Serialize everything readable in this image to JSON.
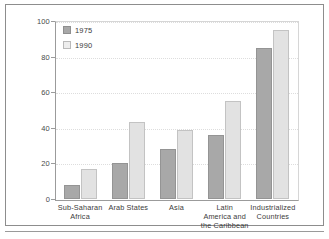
{
  "chart_data": {
    "type": "bar",
    "title": "",
    "subtitle": "",
    "xlabel": "",
    "ylabel": "",
    "ylim": [
      0,
      100
    ],
    "yticks": [
      0,
      20,
      40,
      60,
      80,
      100
    ],
    "grid": true,
    "legend_position": "top-left",
    "categories": [
      "Sub-Saharan Africa",
      "Arab States",
      "Asia",
      "Latin America and the Caribbean",
      "Industrialized Countries"
    ],
    "category_lines": [
      [
        "Sub-Saharan",
        "Africa"
      ],
      [
        "Arab States"
      ],
      [
        "Asia"
      ],
      [
        "Latin",
        "America and",
        "the Caribbean"
      ],
      [
        "Industrialized",
        "Countries"
      ]
    ],
    "series": [
      {
        "name": "1975",
        "color": "#a8a8a8",
        "values": [
          8,
          20,
          28,
          36,
          85
        ]
      },
      {
        "name": "1990",
        "color": "#e2e2e2",
        "values": [
          17,
          43,
          39,
          55,
          95
        ]
      }
    ]
  },
  "legend": {
    "items": [
      {
        "label": "1975",
        "swatch": "legend-swatch-1975"
      },
      {
        "label": "1990",
        "swatch": "legend-swatch-1990"
      }
    ]
  },
  "axis": {
    "y_tick_labels": [
      "100",
      "80",
      "60",
      "40",
      "20",
      "0"
    ]
  },
  "colors": {
    "series_1975": "#a8a8a8",
    "series_1990": "#e2e2e2",
    "axis": "#9b9b9b",
    "grid": "#dddddd",
    "frame": "#8d8d8d",
    "text": "#3c3c3c",
    "background": "#ffffff"
  }
}
